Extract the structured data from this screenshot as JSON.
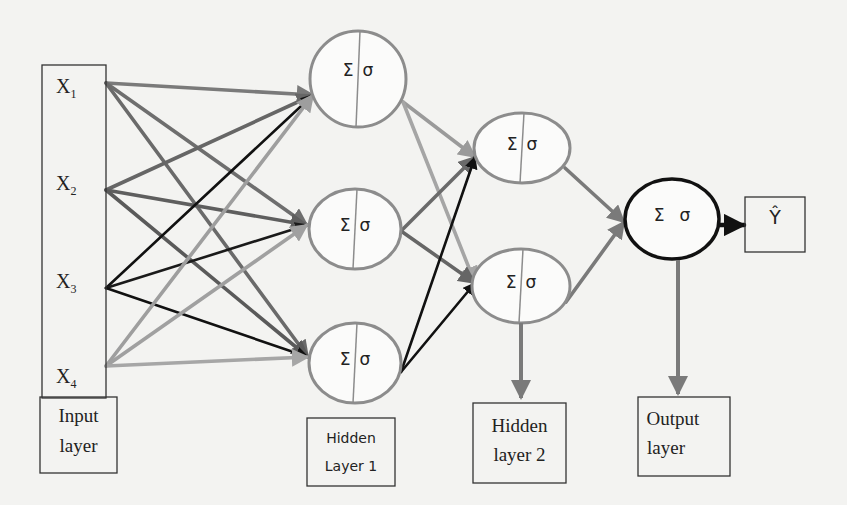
{
  "diagram": {
    "inputs": [
      {
        "id": "x1",
        "label": "X",
        "sub": "1"
      },
      {
        "id": "x2",
        "label": "X",
        "sub": "2"
      },
      {
        "id": "x3",
        "label": "X",
        "sub": "3"
      },
      {
        "id": "x4",
        "label": "X",
        "sub": "4"
      }
    ],
    "node_symbols": {
      "sum": "Σ",
      "activation": "σ"
    },
    "hidden1": [
      {
        "id": "h1a"
      },
      {
        "id": "h1b"
      },
      {
        "id": "h1c"
      }
    ],
    "hidden2": [
      {
        "id": "h2a"
      },
      {
        "id": "h2b"
      }
    ],
    "output_node": {
      "id": "out"
    },
    "output_value": "Ŷ",
    "layer_labels": {
      "input": [
        "Input",
        "layer"
      ],
      "hidden1": [
        "Hidden",
        "Layer 1"
      ],
      "hidden2": [
        "Hidden",
        "layer 2"
      ],
      "output": [
        "Output",
        "layer"
      ]
    },
    "edges": [
      {
        "from": "x1",
        "to": "h1a",
        "color": "#7a7a7a"
      },
      {
        "from": "x1",
        "to": "h1b",
        "color": "#6e6e6e"
      },
      {
        "from": "x1",
        "to": "h1c",
        "color": "#6a6a6a"
      },
      {
        "from": "x2",
        "to": "h1a",
        "color": "#666666"
      },
      {
        "from": "x2",
        "to": "h1b",
        "color": "#5e5e5e"
      },
      {
        "from": "x2",
        "to": "h1c",
        "color": "#5a5a5a"
      },
      {
        "from": "x3",
        "to": "h1a",
        "color": "#111111"
      },
      {
        "from": "x3",
        "to": "h1b",
        "color": "#1a1a1a"
      },
      {
        "from": "x3",
        "to": "h1c",
        "color": "#111111"
      },
      {
        "from": "x4",
        "to": "h1a",
        "color": "#9e9e9e"
      },
      {
        "from": "x4",
        "to": "h1b",
        "color": "#a0a0a0"
      },
      {
        "from": "x4",
        "to": "h1c",
        "color": "#a6a6a6"
      },
      {
        "from": "h1a",
        "to": "h2a",
        "color": "#9a9a9a"
      },
      {
        "from": "h1a",
        "to": "h2b",
        "color": "#a5a5a5"
      },
      {
        "from": "h1b",
        "to": "h2a",
        "color": "#6a6a6a"
      },
      {
        "from": "h1b",
        "to": "h2b",
        "color": "#666666"
      },
      {
        "from": "h1c",
        "to": "h2a",
        "color": "#111111"
      },
      {
        "from": "h1c",
        "to": "h2b",
        "color": "#111111"
      },
      {
        "from": "h2a",
        "to": "out",
        "color": "#7a7a7a"
      },
      {
        "from": "h2b",
        "to": "out",
        "color": "#7a7a7a"
      },
      {
        "from": "out",
        "to": "yhat",
        "color": "#111111"
      }
    ],
    "colors": {
      "background": "#f3f3f1",
      "node_gray": "#8c8c8c",
      "node_dark": "#111111",
      "pointer": "#7a7a7a"
    }
  }
}
